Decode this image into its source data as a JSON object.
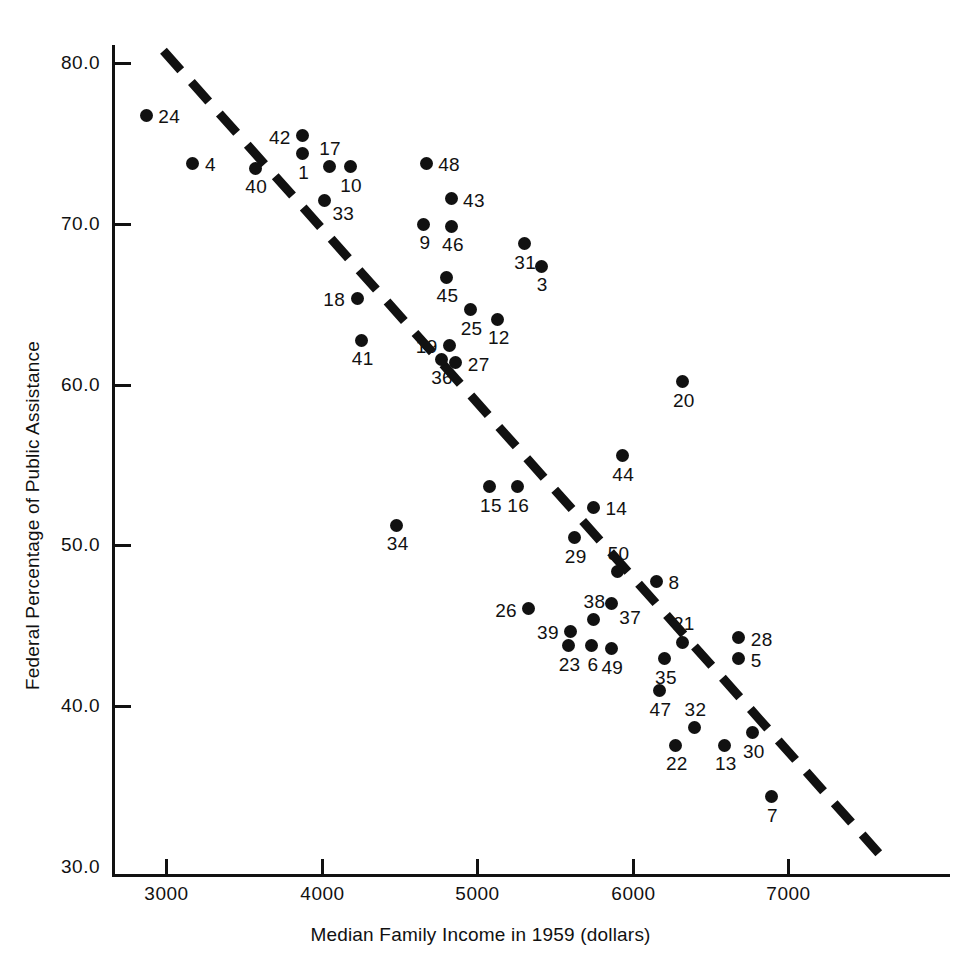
{
  "chart_data": {
    "type": "scatter",
    "title": "",
    "xlabel": "Median Family Income in 1959 (dollars)",
    "ylabel": "Federal Percentage of Public Assistance",
    "xlim": [
      2600,
      7600
    ],
    "ylim": [
      29.0,
      81.5
    ],
    "xticks": [
      "3000",
      "4000",
      "5000",
      "6000",
      "7000"
    ],
    "xtick_values": [
      3000,
      4000,
      5000,
      6000,
      7000
    ],
    "yticks": [
      "80.0",
      "70.0",
      "60.0",
      "50.0",
      "40.0",
      "30.0"
    ],
    "ytick_values": [
      80.0,
      70.0,
      60.0,
      50.0,
      40.0,
      30.0
    ],
    "grid": false,
    "legend": "none",
    "point_style": "filled-circle-black",
    "trendline": {
      "style": "dashed",
      "color": "#111111",
      "x_start": 2990,
      "y_start": 80.7,
      "x_end": 7590,
      "y_end": 30.8
    },
    "points": [
      {
        "label": "24",
        "x": 2880,
        "y": 76.7,
        "lp": "r"
      },
      {
        "label": "4",
        "x": 3180,
        "y": 73.7,
        "lp": "r"
      },
      {
        "label": "40",
        "x": 3580,
        "y": 73.4,
        "lp": "b"
      },
      {
        "label": "42",
        "x": 3885,
        "y": 75.4,
        "lp": "l"
      },
      {
        "label": "1",
        "x": 3885,
        "y": 74.3,
        "lp": "b"
      },
      {
        "label": "17",
        "x": 4055,
        "y": 73.5,
        "lp": "t"
      },
      {
        "label": "10",
        "x": 4190,
        "y": 73.5,
        "lp": "b"
      },
      {
        "label": "33",
        "x": 4025,
        "y": 71.4,
        "lp": "br"
      },
      {
        "label": "48",
        "x": 4680,
        "y": 73.7,
        "lp": "r"
      },
      {
        "label": "43",
        "x": 4840,
        "y": 71.5,
        "lp": "r"
      },
      {
        "label": "9",
        "x": 4665,
        "y": 69.9,
        "lp": "b"
      },
      {
        "label": "46",
        "x": 4845,
        "y": 69.8,
        "lp": "b"
      },
      {
        "label": "31",
        "x": 5310,
        "y": 68.7,
        "lp": "b"
      },
      {
        "label": "3",
        "x": 5420,
        "y": 67.3,
        "lp": "b"
      },
      {
        "label": "45",
        "x": 4810,
        "y": 66.6,
        "lp": "b"
      },
      {
        "label": "18",
        "x": 4235,
        "y": 65.3,
        "lp": "l"
      },
      {
        "label": "25",
        "x": 4965,
        "y": 64.6,
        "lp": "b"
      },
      {
        "label": "12",
        "x": 5140,
        "y": 64.0,
        "lp": "b"
      },
      {
        "label": "41",
        "x": 4265,
        "y": 62.7,
        "lp": "b"
      },
      {
        "label": "19",
        "x": 4830,
        "y": 62.4,
        "lp": "l"
      },
      {
        "label": "36",
        "x": 4775,
        "y": 61.5,
        "lp": "b"
      },
      {
        "label": "27",
        "x": 4870,
        "y": 61.3,
        "lp": "r"
      },
      {
        "label": "20",
        "x": 6330,
        "y": 60.1,
        "lp": "b"
      },
      {
        "label": "44",
        "x": 5940,
        "y": 55.5,
        "lp": "b"
      },
      {
        "label": "15",
        "x": 5090,
        "y": 53.6,
        "lp": "b"
      },
      {
        "label": "16",
        "x": 5265,
        "y": 53.6,
        "lp": "b"
      },
      {
        "label": "14",
        "x": 5755,
        "y": 52.3,
        "lp": "r"
      },
      {
        "label": "34",
        "x": 4490,
        "y": 51.2,
        "lp": "b"
      },
      {
        "label": "29",
        "x": 5635,
        "y": 50.4,
        "lp": "b"
      },
      {
        "label": "50",
        "x": 5910,
        "y": 48.3,
        "lp": "t"
      },
      {
        "label": "8",
        "x": 6160,
        "y": 47.7,
        "lp": "r"
      },
      {
        "label": "26",
        "x": 5340,
        "y": 46.0,
        "lp": "l"
      },
      {
        "label": "37",
        "x": 5870,
        "y": 46.3,
        "lp": "br"
      },
      {
        "label": "38",
        "x": 5755,
        "y": 45.3,
        "lp": "t"
      },
      {
        "label": "39",
        "x": 5610,
        "y": 44.6,
        "lp": "l"
      },
      {
        "label": "23",
        "x": 5595,
        "y": 43.7,
        "lp": "b"
      },
      {
        "label": "6",
        "x": 5745,
        "y": 43.7,
        "lp": "b"
      },
      {
        "label": "49",
        "x": 5870,
        "y": 43.5,
        "lp": "b"
      },
      {
        "label": "21",
        "x": 6330,
        "y": 43.9,
        "lp": "t"
      },
      {
        "label": "28",
        "x": 6690,
        "y": 44.2,
        "lp": "r"
      },
      {
        "label": "5",
        "x": 6690,
        "y": 42.9,
        "lp": "r"
      },
      {
        "label": "35",
        "x": 6215,
        "y": 42.9,
        "lp": "b"
      },
      {
        "label": "47",
        "x": 6180,
        "y": 40.9,
        "lp": "b"
      },
      {
        "label": "32",
        "x": 6405,
        "y": 38.6,
        "lp": "t"
      },
      {
        "label": "30",
        "x": 6780,
        "y": 38.3,
        "lp": "b"
      },
      {
        "label": "22",
        "x": 6285,
        "y": 37.5,
        "lp": "b"
      },
      {
        "label": "13",
        "x": 6600,
        "y": 37.5,
        "lp": "b"
      },
      {
        "label": "7",
        "x": 6900,
        "y": 34.3,
        "lp": "b"
      }
    ]
  }
}
